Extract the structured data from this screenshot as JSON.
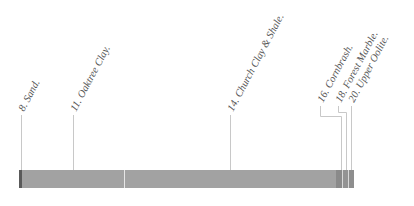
{
  "diagram": {
    "type": "stratigraphic-strip",
    "bar": {
      "x": 19,
      "y": 170,
      "width": 335,
      "height": 18
    },
    "segments": [
      {
        "x0": 19,
        "x1": 22,
        "color": "#5a5a5a"
      },
      {
        "x0": 22,
        "x1": 124,
        "color": "#a2a2a2"
      },
      {
        "x0": 124,
        "x1": 125,
        "color": "#e6e6e6"
      },
      {
        "x0": 125,
        "x1": 336,
        "color": "#a2a2a2"
      },
      {
        "x0": 336,
        "x1": 342,
        "color": "#8a8a8a"
      },
      {
        "x0": 342,
        "x1": 343,
        "color": "#d8d8d8"
      },
      {
        "x0": 343,
        "x1": 348,
        "color": "#939393"
      },
      {
        "x0": 348,
        "x1": 349,
        "color": "#d8d8d8"
      },
      {
        "x0": 349,
        "x1": 354,
        "color": "#8e8e8e"
      }
    ],
    "labels": [
      {
        "text": "8. Sand.",
        "anchor_x": 21,
        "label_x": 21,
        "label_y": 112,
        "elbow_y": null
      },
      {
        "text": "11. Oaktree Clay.",
        "anchor_x": 73,
        "label_x": 73,
        "label_y": 112,
        "elbow_y": null
      },
      {
        "text": "14. Church Clay & Shale.",
        "anchor_x": 230,
        "label_x": 230,
        "label_y": 112,
        "elbow_y": null
      },
      {
        "text": "16. Cornbrash.",
        "anchor_x": 341,
        "label_x": 320,
        "label_y": 103,
        "elbow_y": 116
      },
      {
        "text": "18. Forest Marble.",
        "anchor_x": 346,
        "label_x": 338,
        "label_y": 103,
        "elbow_y": 112
      },
      {
        "text": "20. Upper Oolite.",
        "anchor_x": 351,
        "label_x": 351,
        "label_y": 103,
        "elbow_y": null
      }
    ]
  }
}
